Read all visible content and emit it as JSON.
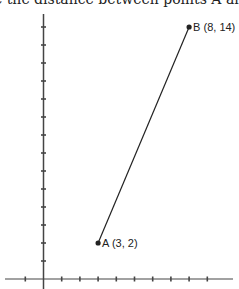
{
  "question": {
    "text": "e the distance between points A and B."
  },
  "chart_data": {
    "type": "scatter",
    "title": "",
    "xlabel": "",
    "ylabel": "",
    "grid": false,
    "xlim": [
      -1,
      10
    ],
    "ylim": [
      -0.5,
      14.7
    ],
    "x_ticks": [
      -1,
      1,
      2,
      3,
      4,
      5,
      6,
      7,
      8,
      9
    ],
    "y_ticks": [
      1,
      2,
      3,
      4,
      5,
      6,
      7,
      8,
      9,
      10,
      11,
      12,
      13,
      14
    ],
    "points": [
      {
        "name": "A",
        "x": 3,
        "y": 2,
        "label": "A (3, 2)"
      },
      {
        "name": "B",
        "x": 8,
        "y": 14,
        "label": "B (8, 14)"
      }
    ],
    "segments": [
      {
        "from": "A",
        "to": "B"
      }
    ]
  },
  "colors": {
    "axis": "#444444",
    "line": "#222222",
    "text": "#222222"
  }
}
